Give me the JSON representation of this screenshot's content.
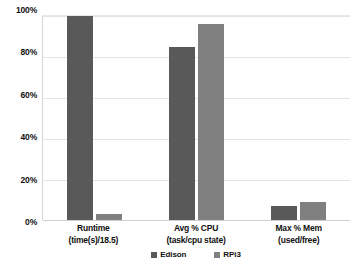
{
  "chart_data": {
    "type": "bar",
    "title": "",
    "subtitle": "",
    "xlabel": "",
    "ylabel": "",
    "ylim": [
      0,
      100
    ],
    "grid": true,
    "legend_position": "bottom",
    "categories": [
      "Runtime (time(s)/18.5)",
      "Avg % CPU (task/cpu state)",
      "Max % Mem (used/free)"
    ],
    "category_lines": [
      {
        "line1": "Runtime",
        "line2": "(time(s)/18.5)"
      },
      {
        "line1": "Avg % CPU",
        "line2": "(task/cpu state)"
      },
      {
        "line1": "Max % Mem",
        "line2": "(used/free)"
      }
    ],
    "series": [
      {
        "name": "Edison",
        "color": "#595959",
        "values": [
          100,
          85,
          7
        ]
      },
      {
        "name": "RPi3",
        "color": "#808080",
        "values": [
          3,
          96,
          9
        ]
      }
    ],
    "ytick_labels": [
      "100%",
      "80%",
      "60%",
      "40%",
      "20%",
      "0%"
    ],
    "ytick_values": [
      100,
      80,
      60,
      40,
      20,
      0
    ]
  },
  "legend": {
    "items": [
      {
        "label": "Edison",
        "color": "#595959"
      },
      {
        "label": "RPi3",
        "color": "#808080"
      }
    ]
  },
  "axis": {
    "y": {
      "ticks": [
        {
          "label": "100%",
          "value": 100
        },
        {
          "label": "80%",
          "value": 80
        },
        {
          "label": "60%",
          "value": 60
        },
        {
          "label": "40%",
          "value": 40
        },
        {
          "label": "20%",
          "value": 20
        },
        {
          "label": "0%",
          "value": 0
        }
      ]
    }
  }
}
